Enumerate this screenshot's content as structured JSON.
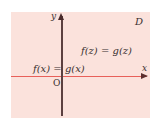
{
  "diagram": {
    "region_label": "D",
    "axes": {
      "x_label": "x",
      "y_label": "y",
      "origin_label": "O"
    },
    "equations": {
      "complex": "f(z) = g(z)",
      "real": "f(x) = g(x)"
    },
    "colors": {
      "region_fill": "#fbe2dc",
      "x_axis": "#e8605a",
      "y_axis": "#5c4040"
    }
  }
}
